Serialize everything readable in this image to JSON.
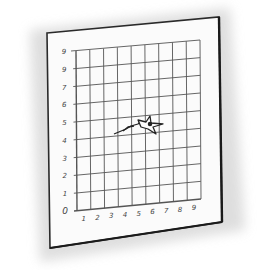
{
  "illustration": {
    "subject": "graph paper sheet with airplane sketch",
    "style": "pencil sketch",
    "colors": {
      "background": "#ffffff",
      "paper": "#fbfbfb",
      "ink": "#2a2a2a",
      "grid": "#555555",
      "shadow": "#cfcfcf"
    }
  },
  "grid": {
    "columns": 9,
    "rows": 9,
    "y_labels": [
      "0",
      "1",
      "2",
      "3",
      "4",
      "5",
      "6",
      "7",
      "9",
      "9"
    ],
    "x_labels": [
      "1",
      "2",
      "3",
      "4",
      "5",
      "6",
      "7",
      "8",
      "9"
    ]
  },
  "figure": {
    "icon": "airplane-icon"
  }
}
